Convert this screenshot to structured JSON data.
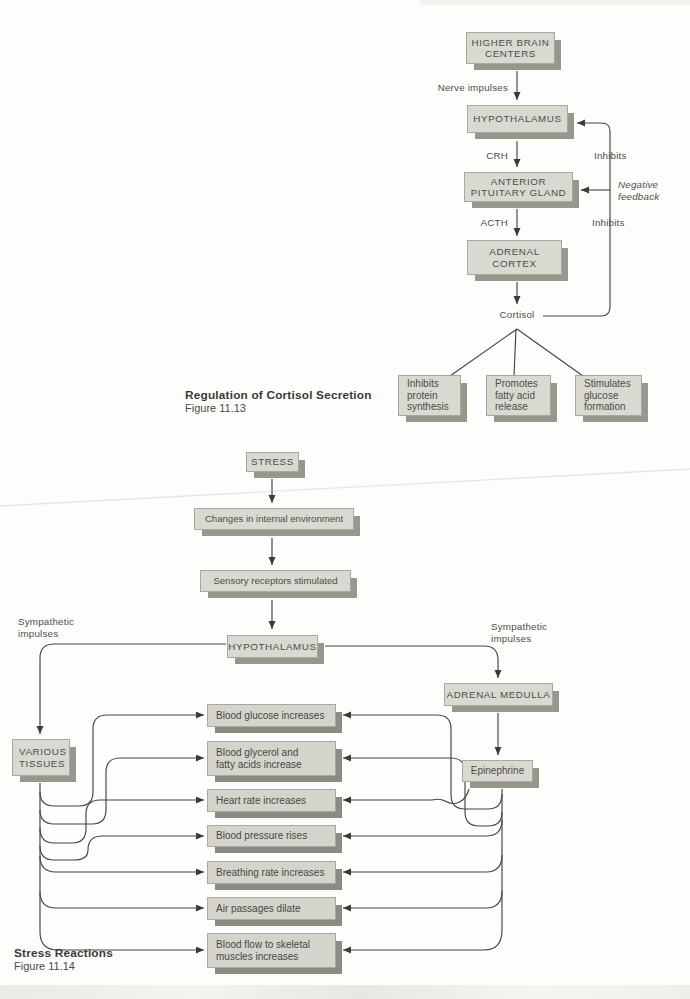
{
  "colors": {
    "box_face": "#d9d9d2",
    "effect_box_face": "#d4d4cc",
    "box_shadow": "#97978e",
    "effect_box_shadow": "#8b8b83",
    "line": "#454542",
    "text": "#4c4c48"
  },
  "fig13": {
    "caption": {
      "title": "Regulation of Cortisol Secretion",
      "figure": "Figure 11.13"
    },
    "boxes": {
      "higher_brain": "HIGHER BRAIN\nCENTERS",
      "hypothalamus": "HYPOTHALAMUS",
      "anterior_pituitary": "ANTERIOR\nPITUITARY GLAND",
      "adrenal_cortex": "ADRENAL\nCORTEX",
      "inhibits_protein": "Inhibits\nprotein\nsynthesis",
      "promotes_fatty": "Promotes\nfatty acid\nrelease",
      "stimulates_glucose": "Stimulates\nglucose\nformation"
    },
    "labels": {
      "nerve_impulses": "Nerve impulses",
      "crh": "CRH",
      "inhibits_upper": "Inhibits",
      "negative_feedback": "Negative\nfeedback",
      "acth": "ACTH",
      "inhibits_lower": "Inhibits",
      "cortisol": "Cortisol"
    }
  },
  "fig14": {
    "caption": {
      "title": "Stress Reactions",
      "figure": "Figure 11.14"
    },
    "boxes": {
      "stress": "STRESS",
      "changes": "Changes in internal environment",
      "sensory": "Sensory receptors stimulated",
      "hypothalamus": "HYPOTHALAMUS",
      "adrenal_medulla": "ADRENAL MEDULLA",
      "epinephrine": "Epinephrine",
      "various_tissues": "VARIOUS\nTISSUES"
    },
    "labels": {
      "sympathetic_left": "Sympathetic\nimpulses",
      "sympathetic_right": "Sympathetic\nimpulses"
    },
    "effects": [
      {
        "label": "Blood glucose increases"
      },
      {
        "label": "Blood glycerol and\nfatty acids increase"
      },
      {
        "label": "Heart rate increases"
      },
      {
        "label": "Blood pressure rises"
      },
      {
        "label": "Breathing rate increases"
      },
      {
        "label": "Air passages dilate"
      },
      {
        "label": "Blood flow to skeletal\nmuscles increases"
      }
    ]
  }
}
